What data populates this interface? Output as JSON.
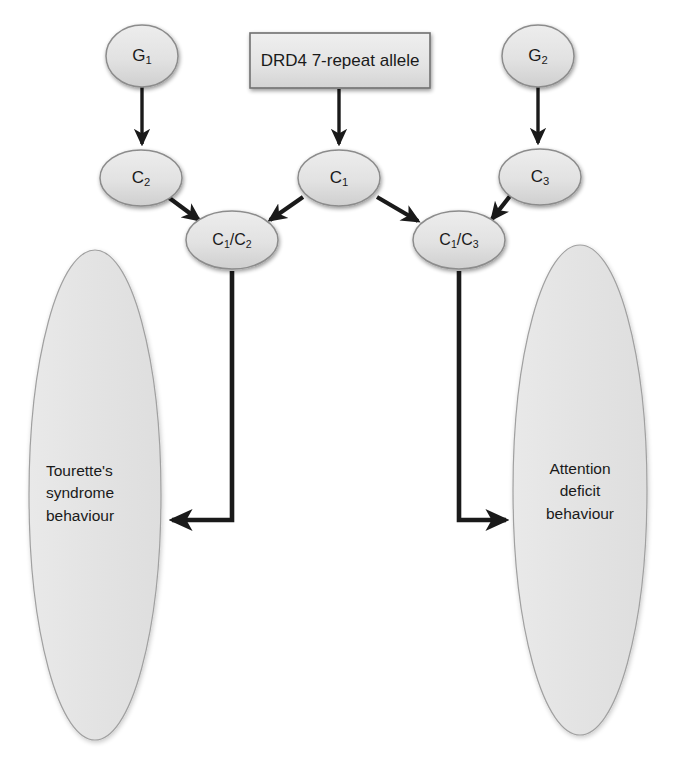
{
  "diagram": {
    "colors": {
      "node_fill_top": "#e8e8e8",
      "node_fill_bottom": "#d2d2d2",
      "node_stroke": "#8a8a8a",
      "box_fill_top": "#ececec",
      "box_fill_bottom": "#d6d6d6",
      "box_stroke": "#6e6e6e",
      "outcome_fill": "#e4e4e4",
      "outcome_stroke": "#9a9a9a",
      "arrow": "#1a1a1a",
      "text": "#1a1a1a",
      "background": "#ffffff"
    },
    "nodes": [
      {
        "id": "g1",
        "type": "ellipse",
        "label": "G1",
        "base": "G",
        "sub": "1",
        "cx": 142,
        "cy": 56,
        "rx": 36,
        "ry": 31
      },
      {
        "id": "g2",
        "type": "ellipse",
        "label": "G2",
        "base": "G",
        "sub": "2",
        "cx": 538,
        "cy": 56,
        "rx": 36,
        "ry": 31
      },
      {
        "id": "drd4",
        "type": "rect",
        "label": "DRD4 7-repeat allele",
        "x": 250,
        "y": 33,
        "w": 180,
        "h": 55
      },
      {
        "id": "c2",
        "type": "ellipse",
        "label": "C2",
        "base": "C",
        "sub": "2",
        "cx": 141,
        "cy": 178,
        "rx": 41,
        "ry": 28
      },
      {
        "id": "c1",
        "type": "ellipse",
        "label": "C1",
        "base": "C",
        "sub": "1",
        "cx": 339,
        "cy": 178,
        "rx": 41,
        "ry": 28
      },
      {
        "id": "c3",
        "type": "ellipse",
        "label": "C3",
        "base": "C",
        "sub": "3",
        "cx": 540,
        "cy": 177,
        "rx": 41,
        "ry": 28
      },
      {
        "id": "c1c2",
        "type": "ellipse",
        "label": "C1/C2",
        "cx": 232,
        "cy": 240,
        "rx": 46,
        "ry": 29
      },
      {
        "id": "c1c3",
        "type": "ellipse",
        "label": "C1/C3",
        "cx": 459,
        "cy": 240,
        "rx": 46,
        "ry": 29
      }
    ],
    "outcomes": [
      {
        "id": "tourettes",
        "cx": 95,
        "cy": 495,
        "rx": 66,
        "ry": 245,
        "lines": [
          "Tourette's",
          "syndrome",
          "behaviour"
        ],
        "align": "left"
      },
      {
        "id": "attention-deficit",
        "cx": 580,
        "cy": 490,
        "rx": 67,
        "ry": 245,
        "lines": [
          "Attention",
          "deficit",
          "behaviour"
        ],
        "align": "center"
      }
    ],
    "edges": [
      {
        "id": "g1-to-c2",
        "from": "g1",
        "to": "c2",
        "style": "straight-down"
      },
      {
        "id": "g2-to-c3",
        "from": "g2",
        "to": "c3",
        "style": "straight-down"
      },
      {
        "id": "drd4-to-c1",
        "from": "drd4",
        "to": "c1",
        "style": "straight-down"
      },
      {
        "id": "c2-to-c1c2",
        "from": "c2",
        "to": "c1c2",
        "style": "diagonal"
      },
      {
        "id": "c1-to-c1c2",
        "from": "c1",
        "to": "c1c2",
        "style": "diagonal"
      },
      {
        "id": "c1-to-c1c3",
        "from": "c1",
        "to": "c1c3",
        "style": "diagonal"
      },
      {
        "id": "c3-to-c1c3",
        "from": "c3",
        "to": "c1c3",
        "style": "diagonal"
      },
      {
        "id": "c1c2-to-tourettes",
        "from": "c1c2",
        "to": "tourettes",
        "style": "elbow-left"
      },
      {
        "id": "c1c3-to-attention-deficit",
        "from": "c1c3",
        "to": "attention-deficit",
        "style": "elbow-right"
      }
    ]
  }
}
